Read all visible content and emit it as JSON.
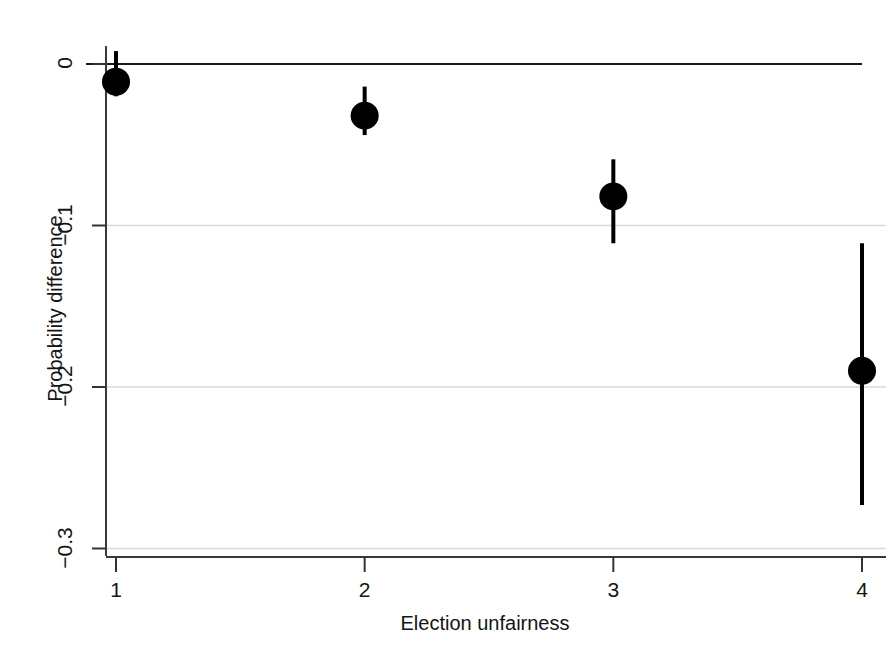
{
  "chart_data": {
    "type": "scatter",
    "title": "",
    "subtitle": "",
    "xlabel": "Election unfairness",
    "ylabel": "Probability difference",
    "x": [
      1,
      2,
      3,
      4
    ],
    "categories": [
      "1",
      "2",
      "3",
      "4"
    ],
    "values": [
      -0.011,
      -0.032,
      -0.082,
      -0.19
    ],
    "error_low": [
      -0.02,
      -0.044,
      -0.111,
      -0.273
    ],
    "error_high": [
      0.008,
      -0.014,
      -0.059,
      -0.111
    ],
    "series": [
      {
        "name": "Probability difference",
        "values": [
          -0.011,
          -0.032,
          -0.082,
          -0.19
        ],
        "error_low": [
          -0.02,
          -0.044,
          -0.111,
          -0.273
        ],
        "error_high": [
          0.008,
          -0.014,
          -0.059,
          -0.111
        ]
      }
    ],
    "xlim": [
      0.85,
      4.15
    ],
    "ylim": [
      -0.308,
      0.012
    ],
    "xticks": [
      1,
      2,
      3,
      4
    ],
    "xtick_labels": [
      "1",
      "2",
      "3",
      "4"
    ],
    "yticks": [
      0,
      -0.1,
      -0.2,
      -0.3
    ],
    "ytick_labels": [
      "0",
      "−0.1",
      "−0.2",
      "−0.3"
    ],
    "grid": true,
    "gridlines_y": [
      -0.1,
      -0.2,
      -0.3
    ],
    "reference_line_y": 0,
    "legend": null,
    "legend_position": "none",
    "marker": "filled-circle",
    "marker_color": "#000000",
    "errorbar_color": "#000000",
    "gridline_color": "#d9d9d9",
    "reference_line_color": "#1a1a1a",
    "axis_color": "#333333",
    "background_color": "#ffffff"
  },
  "axis_titles": {
    "x": "Election unfairness",
    "y": "Probability difference"
  },
  "ticks": {
    "x": [
      "1",
      "2",
      "3",
      "4"
    ],
    "y": [
      "0",
      "−0.1",
      "−0.2",
      "−0.3"
    ]
  }
}
